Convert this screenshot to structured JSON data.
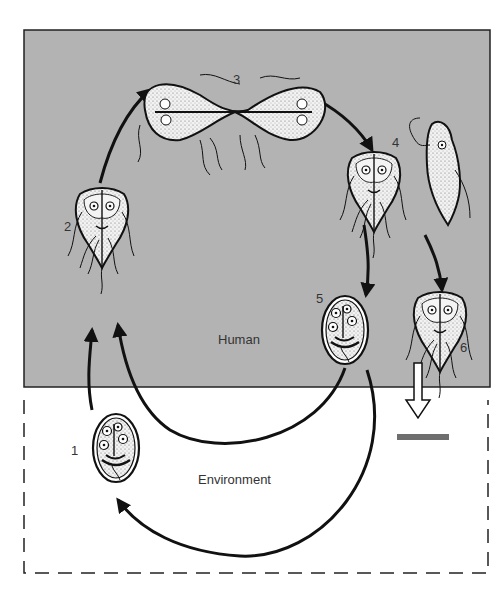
{
  "diagram": {
    "regions": {
      "human": {
        "label": "Human",
        "fill": "#b3b3b3"
      },
      "environment": {
        "label": "Environment",
        "fill": "#ffffff"
      }
    },
    "stages": [
      {
        "number": "1",
        "form": "cyst",
        "region": "environment"
      },
      {
        "number": "2",
        "form": "trophozoite",
        "region": "human"
      },
      {
        "number": "3",
        "form": "dividing trophozoite",
        "region": "human"
      },
      {
        "number": "4",
        "form": "trophozoite",
        "region": "human"
      },
      {
        "number": "5",
        "form": "cyst",
        "region": "human"
      },
      {
        "number": "6",
        "form": "trophozoite",
        "region": "human"
      }
    ],
    "colors": {
      "panel": "#b3b3b3",
      "stroke": "#111111",
      "cell_fill": "#e8e8e8",
      "bar": "#6e6e6e"
    }
  }
}
